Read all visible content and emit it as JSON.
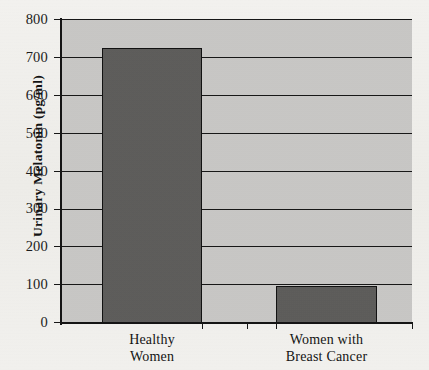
{
  "chart_data": {
    "type": "bar",
    "title": "",
    "subtitle": "",
    "xlabel": "",
    "ylabel": "Urinary Melatonin (pg/ml)",
    "categories": [
      "Healthy Women",
      "Women with Breast Cancer"
    ],
    "category_lines": [
      [
        "Healthy",
        "Women"
      ],
      [
        "Women with",
        "Breast Cancer"
      ]
    ],
    "values": [
      725,
      98
    ],
    "ylim": [
      0,
      800
    ],
    "y_ticks": [
      0,
      100,
      200,
      300,
      400,
      500,
      600,
      700,
      800
    ],
    "y_tick_labels": [
      "0",
      "100",
      "200",
      "300",
      "400",
      "500",
      "600",
      "700",
      "800"
    ],
    "grid": true,
    "grid_orientation": "horizontal",
    "legend": false,
    "legend_position": "none",
    "bar_color": "#5d5c5a",
    "bar_edge_color": "#121212",
    "plot_background": "#c9c8c6",
    "page_background": "#f2f1ee",
    "axis_color": "#141414"
  }
}
